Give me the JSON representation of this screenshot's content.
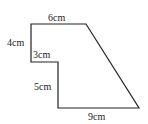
{
  "diagram": {
    "type": "composite-shape",
    "stroke_color": "#222222",
    "background": "#ffffff",
    "vertices": [
      [
        31,
        24
      ],
      [
        86,
        24
      ],
      [
        139,
        108
      ],
      [
        58,
        108
      ],
      [
        58,
        62
      ],
      [
        31,
        62
      ]
    ],
    "labels": {
      "top": "6cm",
      "left_upper": "4cm",
      "step": "3cm",
      "left_lower": "5cm",
      "bottom": "9cm"
    }
  }
}
